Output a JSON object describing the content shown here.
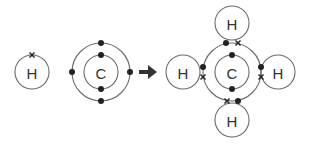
{
  "diagram": {
    "reactants": {
      "hydrogen": {
        "label": "H",
        "electrons": 1,
        "electron_symbol": "cross"
      },
      "carbon": {
        "label": "C",
        "inner_shell_electrons": 2,
        "outer_shell_electrons": 4,
        "electron_symbol": "dot"
      }
    },
    "arrow": {
      "icon": "right-arrow-icon"
    },
    "product": {
      "center": {
        "label": "C"
      },
      "hydrogens": [
        {
          "label": "H",
          "position": "top"
        },
        {
          "label": "H",
          "position": "left"
        },
        {
          "label": "H",
          "position": "right"
        },
        {
          "label": "H",
          "position": "bottom"
        }
      ],
      "shared_pairs": 4
    },
    "colors": {
      "line": "#6b6b6b",
      "electron": "#222222",
      "text": "#333333"
    }
  }
}
